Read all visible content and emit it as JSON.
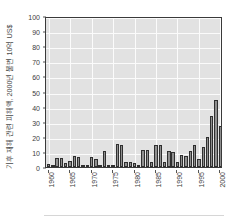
{
  "chart_data": {
    "type": "bar",
    "title": "",
    "subtitle": "",
    "xlabel": "",
    "ylabel": "기후 재해 관련 피해액, 2000년 불변 10억 US$",
    "ylim": [
      0,
      100
    ],
    "ytick_values": [
      0,
      10,
      20,
      30,
      40,
      50,
      60,
      70,
      80,
      90,
      100
    ],
    "ytick_labels": [
      "0",
      "10",
      "20",
      "30",
      "40",
      "50",
      "60",
      "70",
      "80",
      "90",
      "100"
    ],
    "xtick_values": [
      1960,
      1965,
      1970,
      1975,
      1980,
      1985,
      1990,
      1995,
      2000
    ],
    "xtick_labels": [
      "1960",
      "1965",
      "1970",
      "1975",
      "1980",
      "1985",
      "1990",
      "1995",
      "2000"
    ],
    "xlim": [
      1959.4,
      2000.6
    ],
    "grid": "both-white-on-gray",
    "legend": "none",
    "bar_color": "#8f8f8f",
    "bar_edge_color": "#2f2f2f",
    "plot_background": "#e2e2e2",
    "gridline_color": "#fbfbfb",
    "axis_color": "#3a3a3a",
    "categories": [
      "1960",
      "1961",
      "1962",
      "1963",
      "1964",
      "1965",
      "1966",
      "1967",
      "1968",
      "1969",
      "1970",
      "1971",
      "1972",
      "1973",
      "1974",
      "1975",
      "1976",
      "1977",
      "1978",
      "1979",
      "1980",
      "1981",
      "1982",
      "1983",
      "1984",
      "1985",
      "1986",
      "1987",
      "1988",
      "1989",
      "1990",
      "1991",
      "1992",
      "1993",
      "1994",
      "1995",
      "1996",
      "1997",
      "1998",
      "1999",
      "2000"
    ],
    "values": [
      2.2,
      0.5,
      6.2,
      6.0,
      2.8,
      4.0,
      7.6,
      6.4,
      1.3,
      0.4,
      6.6,
      5.0,
      0.7,
      10.3,
      0.6,
      1.0,
      15.0,
      14.8,
      3.0,
      3.6,
      2.9,
      0.8,
      11.5,
      11.2,
      3.0,
      14.7,
      14.6,
      3.4,
      10.8,
      10.2,
      3.6,
      7.8,
      7.5,
      10.8,
      14.6,
      5.0,
      13.3,
      20.2,
      34.0,
      44.2,
      27.0
    ],
    "values_note": "bar heights in billions of constant-2000 US$"
  },
  "axes": {
    "y_title": "기후 재해 관련 피해액, 2000년 불변 10억 US$"
  }
}
